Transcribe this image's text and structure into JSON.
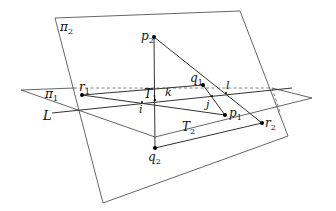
{
  "diagram": {
    "planes": [
      {
        "id": "pi2",
        "label": "π",
        "subscript": "2",
        "points": [
          [
            55,
            18
          ],
          [
            240,
            11
          ],
          [
            288,
            136
          ],
          [
            103,
            203
          ]
        ]
      },
      {
        "id": "pi1",
        "label": "π",
        "subscript": "1",
        "points": [
          [
            21,
            90
          ],
          [
            312,
            98
          ],
          [
            155,
            137
          ]
        ]
      }
    ],
    "line_L": {
      "label": "L",
      "from": [
        52,
        113
      ],
      "to": [
        292,
        88
      ]
    },
    "triangles": [
      {
        "id": "T1",
        "label": "T",
        "subscript": "1",
        "vertices": [
          "r1",
          "q1",
          "p1"
        ]
      },
      {
        "id": "T2",
        "label": "T",
        "subscript": "2",
        "vertices": [
          "p2",
          "q2",
          "r2"
        ]
      }
    ],
    "points": {
      "p2": {
        "label": "p",
        "subscript": "2",
        "xy": [
          154,
          37
        ]
      },
      "q1": {
        "label": "q",
        "subscript": "1",
        "xy": [
          203,
          85
        ]
      },
      "p1": {
        "label": "p",
        "subscript": "1",
        "xy": [
          225,
          115
        ]
      },
      "r1": {
        "label": "r",
        "subscript": "1",
        "xy": [
          82,
          95
        ]
      },
      "r2": {
        "label": "r",
        "subscript": "2",
        "xy": [
          262,
          123
        ]
      },
      "q2": {
        "label": "q",
        "subscript": "2",
        "xy": [
          155,
          148
        ]
      }
    },
    "intersections": {
      "i": {
        "label": "i",
        "xy": [
          142,
          102
        ]
      },
      "k": {
        "label": "k",
        "xy": [
          160,
          100
        ]
      },
      "j": {
        "label": "j",
        "xy": [
          212,
          96
        ]
      },
      "l": {
        "label": "l",
        "xy": [
          226,
          93
        ]
      }
    },
    "labels": {
      "pi2": "π",
      "pi2_sub": "2",
      "pi1": "π",
      "pi1_sub": "1",
      "L": "L",
      "T1": "T",
      "T1_sub": "1",
      "T2": "T",
      "T2_sub": "2",
      "p2": "p",
      "p2_sub": "2",
      "q1": "q",
      "q1_sub": "1",
      "p1": "p",
      "p1_sub": "1",
      "r1": "r",
      "r1_sub": "1",
      "r2": "r",
      "r2_sub": "2",
      "q2": "q",
      "q2_sub": "2",
      "i": "i",
      "j": "j",
      "k": "k",
      "l": "l"
    },
    "colors": {
      "line": "#333333",
      "plane": "#555555",
      "point": "#000000"
    }
  }
}
